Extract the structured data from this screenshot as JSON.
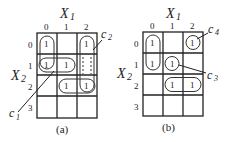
{
  "figure": {
    "panels": [
      {
        "id": "a",
        "caption": "(a)",
        "col_var": "X1",
        "row_var": "X2",
        "col_labels": [
          "0",
          "1",
          "2"
        ],
        "row_labels": [
          "0",
          "1",
          "2",
          "3"
        ],
        "cells": [
          {
            "row": 0,
            "col": 0,
            "value": "1"
          },
          {
            "row": 0,
            "col": 2,
            "value": "1"
          },
          {
            "row": 1,
            "col": 0,
            "value": "1"
          },
          {
            "row": 1,
            "col": 1,
            "value": "1"
          },
          {
            "row": 2,
            "col": 1,
            "value": "1"
          },
          {
            "row": 2,
            "col": 2,
            "value": "1"
          }
        ],
        "groups": [
          "c1",
          "c2"
        ],
        "annotations": {
          "c1": "c1",
          "c2": "c2"
        }
      },
      {
        "id": "b",
        "caption": "(b)",
        "col_var": "X1",
        "row_var": "X2",
        "col_labels": [
          "0",
          "1",
          "2"
        ],
        "row_labels": [
          "0",
          "1",
          "2",
          "3"
        ],
        "cells": [
          {
            "row": 0,
            "col": 0,
            "value": "1"
          },
          {
            "row": 0,
            "col": 2,
            "value": "1"
          },
          {
            "row": 1,
            "col": 0,
            "value": "1"
          },
          {
            "row": 1,
            "col": 1,
            "value": "1"
          },
          {
            "row": 2,
            "col": 1,
            "value": "1"
          },
          {
            "row": 2,
            "col": 2,
            "value": "1"
          }
        ],
        "groups": [
          "c3",
          "c4"
        ],
        "annotations": {
          "c3": "c3",
          "c4": "c4"
        }
      }
    ]
  },
  "labels": {
    "x1_main": "X",
    "x1_sub": "1",
    "x2_main": "X",
    "x2_sub": "2",
    "one": "1",
    "c": "c",
    "c1_sub": "1",
    "c2_sub": "2",
    "c3_sub": "3",
    "c4_sub": "4",
    "cap_a": "(a)",
    "cap_b": "(b)",
    "col0": "0",
    "col1": "1",
    "col2": "2",
    "row0": "0",
    "row1": "1",
    "row2": "2",
    "row3": "3"
  }
}
